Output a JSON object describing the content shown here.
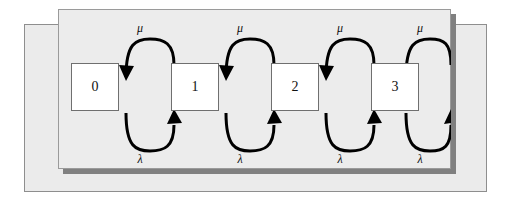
{
  "figure": {
    "type": "state-transition-diagram",
    "colors": {
      "page_background": "#ffffff",
      "outer_panel_fill": "#ebebeb",
      "outer_panel_border": "#8e8e8e",
      "inner_panel_fill": "#ececec",
      "inner_panel_border": "#9a9a9a",
      "inner_panel_shadow": "#808080",
      "state_box_fill": "#ffffff",
      "state_box_border": "#6f6f6f",
      "arrow_stroke": "#000000",
      "text": "#111111"
    }
  },
  "states": [
    {
      "label": "0",
      "x": 13,
      "y": 54
    },
    {
      "label": "1",
      "x": 113,
      "y": 54
    },
    {
      "label": "2",
      "x": 213,
      "y": 54
    },
    {
      "label": "3",
      "x": 313,
      "y": 54
    }
  ],
  "transitions": {
    "upper": [
      {
        "label": "μ",
        "direction": "left",
        "from": "1",
        "to": "0",
        "label_x": 80,
        "label_y": 19
      },
      {
        "label": "μ",
        "direction": "left",
        "from": "2",
        "to": "1",
        "label_x": 180,
        "label_y": 19
      },
      {
        "label": "μ",
        "direction": "left",
        "from": "3",
        "to": "2",
        "label_x": 280,
        "label_y": 19
      },
      {
        "label": "μ",
        "direction": "left",
        "from": "4",
        "to": "3",
        "label_x": 360,
        "label_y": 19
      }
    ],
    "lower": [
      {
        "label": "λ",
        "direction": "right",
        "from": "0",
        "to": "1",
        "label_x": 80,
        "label_y": 130
      },
      {
        "label": "λ",
        "direction": "right",
        "from": "1",
        "to": "2",
        "label_x": 180,
        "label_y": 130
      },
      {
        "label": "λ",
        "direction": "right",
        "from": "2",
        "to": "3",
        "label_x": 280,
        "label_y": 130
      },
      {
        "label": "λ",
        "direction": "right",
        "from": "3",
        "to": "4",
        "label_x": 360,
        "label_y": 130
      }
    ]
  }
}
